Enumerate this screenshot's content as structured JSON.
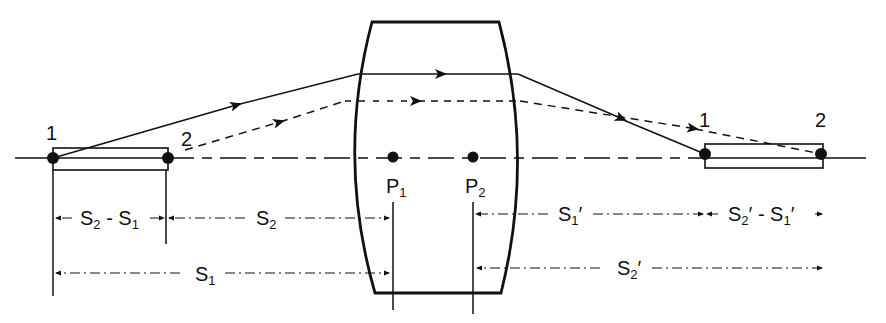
{
  "figure": {
    "type": "thick-lens-longitudinal-magnification",
    "colors": {
      "ink": "#111111",
      "background": "#ffffff"
    }
  },
  "object": {
    "point1_label": "1",
    "point2_label": "2"
  },
  "image": {
    "point1_label": "1",
    "point2_label": "2"
  },
  "principal_points": {
    "p1": {
      "main": "P",
      "sub": "1"
    },
    "p2": {
      "main": "P",
      "sub": "2"
    }
  },
  "dimensions": {
    "s2_minus_s1": {
      "a": "S",
      "a_sub": "2",
      "op": " - ",
      "b": "S",
      "b_sub": "1"
    },
    "s2": {
      "main": "S",
      "sub": "2"
    },
    "s1": {
      "main": "S",
      "sub": "1"
    },
    "s1_prime": {
      "main": "S",
      "sub": "1",
      "prime": "′"
    },
    "s2p_minus_s1p": {
      "a": "S",
      "a_sub": "2",
      "a_prime": "′",
      "op": " - ",
      "b": "S",
      "b_sub": "1",
      "b_prime": "′"
    },
    "s2_prime": {
      "main": "S",
      "sub": "2",
      "prime": "′"
    }
  }
}
